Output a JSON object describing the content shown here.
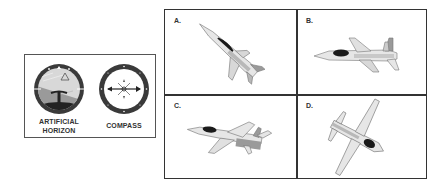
{
  "instruments": {
    "artificial_horizon": {
      "label": "ARTIFICIAL HORIZON",
      "label_line1": "ARTIFICIAL",
      "label_line2": "HORIZON"
    },
    "compass": {
      "label": "COMPASS"
    }
  },
  "options": [
    {
      "letter": "A.",
      "description": "jet climbing steeply, nose up-left"
    },
    {
      "letter": "B.",
      "description": "jet in level flight heading left"
    },
    {
      "letter": "C.",
      "description": "jet banking, heading left"
    },
    {
      "letter": "D.",
      "description": "jet viewed from above, banked steeply"
    }
  ],
  "colors": {
    "sky": "#cfcfcf",
    "ground": "#2a2a2a",
    "bezel": "#3a3a3a",
    "plane_light": "#e6e6e6",
    "plane_mid": "#b8b8b8",
    "canopy": "#1a1a1a"
  }
}
